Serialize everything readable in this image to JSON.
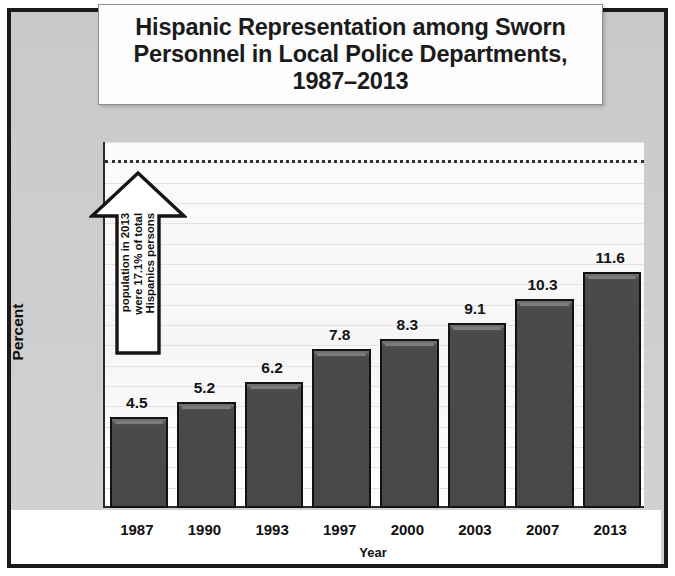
{
  "title": "Hispanic Representation among Sworn\nPersonnel in Local Police Departments,\n1987–2013",
  "annotation": {
    "line1": "Hispanics persons",
    "line2": "were 17.1% of total",
    "line3": "population in 2013"
  },
  "chart_data": {
    "type": "bar",
    "xlabel": "Year",
    "ylabel": "Percent",
    "categories": [
      "1987",
      "1990",
      "1993",
      "1997",
      "2000",
      "2003",
      "2007",
      "2013"
    ],
    "values": [
      4.5,
      5.2,
      6.2,
      7.8,
      8.3,
      9.1,
      10.3,
      11.6
    ],
    "value_labels": [
      "4.5",
      "5.2",
      "6.2",
      "7.8",
      "8.3",
      "9.1",
      "10.3",
      "11.6"
    ],
    "ylim": [
      0,
      18
    ],
    "ytick_labels": [
      "0",
      "1",
      "2",
      "3",
      "4",
      "5",
      "6",
      "7",
      "8",
      "9",
      "10",
      "11",
      "12",
      "13",
      "14",
      "15",
      "16",
      "17",
      "18"
    ],
    "ytick_values": [
      0,
      1,
      2,
      3,
      4,
      5,
      6,
      7,
      8,
      9,
      10,
      11,
      12,
      13,
      14,
      15,
      16,
      17,
      18
    ],
    "grid": true,
    "legend": false,
    "reference_line": {
      "value": 17.1,
      "style": "dotted",
      "label": "Hispanics persons were 17.1% of total population in 2013"
    },
    "bar_color": "#4a4a4a",
    "bar_border_color": "#121212",
    "plot_background": "#fbfbfb",
    "figure_background": "#cdcdcd"
  }
}
